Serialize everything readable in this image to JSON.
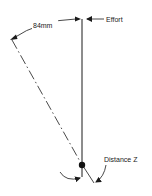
{
  "figure": {
    "labels": {
      "effort": "Effort",
      "arc_length": "84mm",
      "distance": "Distance Z"
    },
    "colors": {
      "ink": "#1a1a1a",
      "background": "#ffffff"
    }
  }
}
